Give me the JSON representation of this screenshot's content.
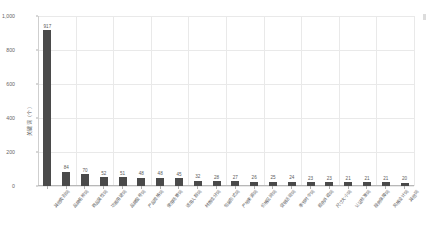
{
  "chart_data": {
    "type": "bar",
    "title": "",
    "xlabel": "",
    "ylabel": "关键词（个）",
    "ylim": [
      0,
      1000
    ],
    "grid": true,
    "legend": false,
    "orientation": "vertical",
    "bar_color": "#4a4a4a",
    "gridline_color": "#e9e9e9",
    "background_color": "#ffffff",
    "y_ticks": [
      "0",
      "200",
      "400",
      "600",
      "800",
      "1,000"
    ],
    "y_tick_values": [
      0,
      200,
      400,
      600,
      800,
      1000
    ],
    "categories": [
      "其他类别词",
      "品牌名称词",
      "商品属性词",
      "功能用途词",
      "品牌型号词",
      "产品规格词",
      "使用场景词",
      "适用人群词",
      "材质成分词",
      "包装形式词",
      "产地来源词",
      "价格区间词",
      "促销活动词",
      "季节时令词",
      "颜色外观词",
      "尺寸大小词",
      "认证标准词",
      "服务保障词",
      "风格设计词",
      "其他词"
    ],
    "values": [
      917,
      84,
      70,
      52,
      51,
      48,
      48,
      45,
      32,
      28,
      27,
      26,
      25,
      24,
      23,
      23,
      21,
      21,
      21,
      20
    ],
    "data_labels": [
      "917",
      "84",
      "70",
      "52",
      "51",
      "48",
      "48",
      "45",
      "32",
      "28",
      "27",
      "26",
      "25",
      "24",
      "23",
      "23",
      "21",
      "21",
      "21",
      "20"
    ]
  }
}
